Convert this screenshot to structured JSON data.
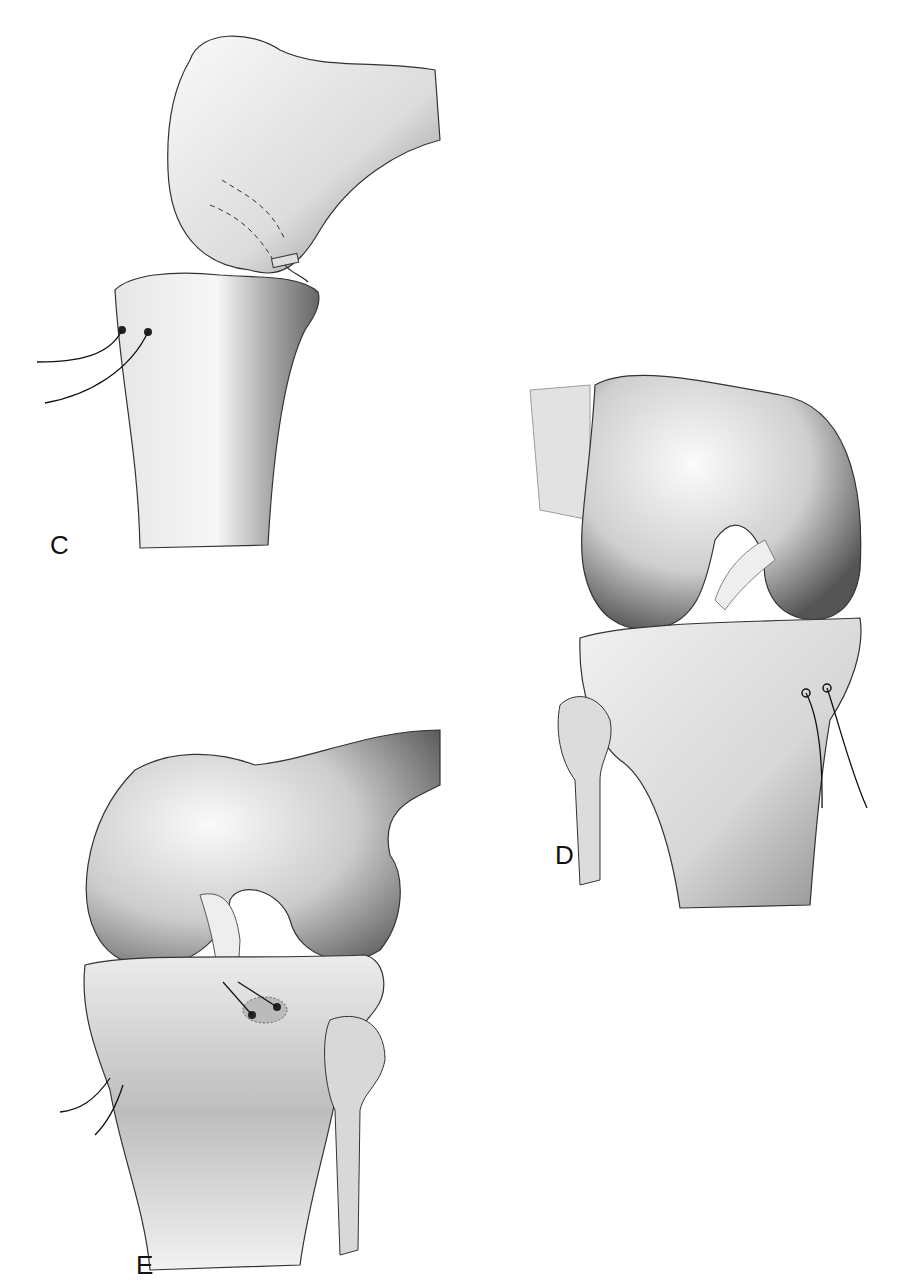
{
  "figure": {
    "panels": [
      {
        "id": "C",
        "label": "C",
        "view": "lateral view of flexed knee: femoral condyle with graft and two suture holes on tibia"
      },
      {
        "id": "D",
        "label": "D",
        "view": "anterolateral view of knee with ligament in notch and sutures exiting medial tibia"
      },
      {
        "id": "E",
        "label": "E",
        "view": "anterior view of knee showing graft fixed to tibial footprint with sutures"
      }
    ]
  },
  "colors": {
    "ink": "#111111",
    "shade_dark": "#5a5a5a",
    "shade_mid": "#9a9a9a",
    "bone_light": "#f4f4f4"
  }
}
